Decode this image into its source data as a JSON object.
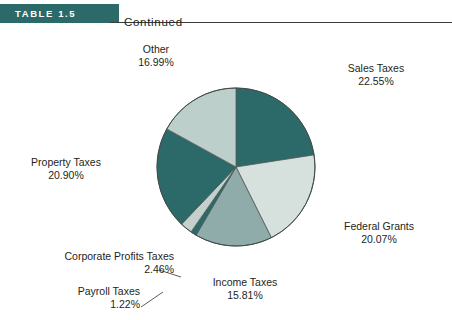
{
  "header": {
    "table_number": "TABLE 1.5",
    "continued_label": "Continued",
    "band_color": "#2b6a68",
    "rule_color": "#3b3b3b"
  },
  "chart_data": {
    "type": "pie",
    "title": "",
    "legend_position": "callout-labels",
    "grid": false,
    "categories": [
      "Sales Taxes",
      "Federal Grants",
      "Income Taxes",
      "Payroll Taxes",
      "Corporate Profits Taxes",
      "Property Taxes",
      "Other"
    ],
    "values": [
      22.55,
      20.07,
      15.81,
      1.22,
      2.46,
      20.9,
      16.99
    ],
    "value_labels": [
      "22.55%",
      "20.07%",
      "15.81%",
      "1.22%",
      "2.46%",
      "20.90%",
      "16.99%"
    ],
    "colors": [
      "#2b6a68",
      "#d6e0dd",
      "#8fabaa",
      "#2b6a68",
      "#c3d1cd",
      "#2b6a68",
      "#bdcfca"
    ],
    "start_angle_deg": 0,
    "direction": "clockwise",
    "units": "percent",
    "slices": [
      {
        "label": "Sales Taxes",
        "value": 22.55,
        "value_text": "22.55%",
        "color": "#2b6a68"
      },
      {
        "label": "Federal Grants",
        "value": 20.07,
        "value_text": "20.07%",
        "color": "#d6e0dd"
      },
      {
        "label": "Income Taxes",
        "value": 15.81,
        "value_text": "15.81%",
        "color": "#8fabaa"
      },
      {
        "label": "Payroll Taxes",
        "value": 1.22,
        "value_text": "1.22%",
        "color": "#2b6a68"
      },
      {
        "label": "Corporate Profits Taxes",
        "value": 2.46,
        "value_text": "2.46%",
        "color": "#c3d1cd"
      },
      {
        "label": "Property Taxes",
        "value": 20.9,
        "value_text": "20.90%",
        "color": "#2b6a68"
      },
      {
        "label": "Other",
        "value": 16.99,
        "value_text": "16.99%",
        "color": "#bdcfca"
      }
    ]
  }
}
